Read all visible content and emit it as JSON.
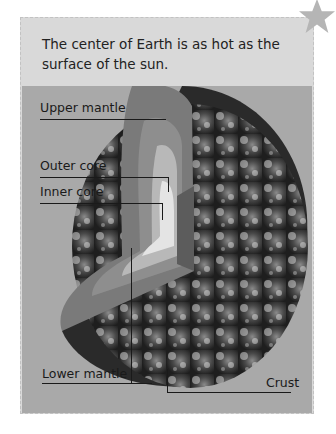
{
  "caption": {
    "text": "The center of Earth is as hot as the surface of the sun."
  },
  "decoration": {
    "star_icon": "star-icon",
    "star_color": "#b5b5b5"
  },
  "figure": {
    "labels": {
      "upper_mantle": "Upper mantle",
      "outer_core": "Outer core",
      "inner_core": "Inner core",
      "lower_mantle": "Lower mantle",
      "crust": "Crust"
    },
    "colors": {
      "background": "#a9a9a9",
      "panel": "#d9d9d9",
      "text": "#1a1a1a"
    }
  }
}
